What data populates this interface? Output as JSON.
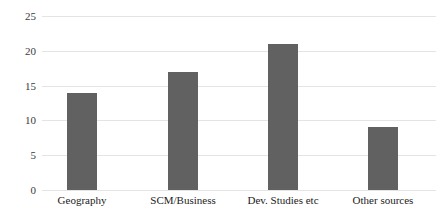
{
  "chart_data": {
    "type": "bar",
    "title": "",
    "subtitle": "",
    "xlabel": "",
    "ylabel": "",
    "categories": [
      "Geography",
      "SCM/Business",
      "Dev. Studies etc",
      "Other sources"
    ],
    "values": [
      14,
      17,
      21,
      9
    ],
    "ylim": [
      0,
      25
    ],
    "yticks": [
      0,
      5,
      10,
      15,
      20,
      25
    ],
    "ytick_labels": [
      "0",
      "5",
      "10",
      "15",
      "20",
      "25"
    ],
    "grid": true,
    "grid_axis": "y",
    "legend": false,
    "legend_position": "none",
    "bar_color": "#616161",
    "gridline_color": "#e4e4e4",
    "background_color": "#ffffff",
    "data_labels": false
  }
}
